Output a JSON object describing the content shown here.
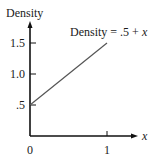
{
  "chart_data": {
    "type": "line",
    "title": "",
    "ylabel": "Density",
    "xlabel": "x",
    "annotation": "Density = .5 + x",
    "annotation_parts": {
      "prefix": "Density = .5 + ",
      "var": "x"
    },
    "xlim": [
      0,
      1.35
    ],
    "ylim": [
      0,
      1.75
    ],
    "x_ticks": [
      {
        "value": 1,
        "label": "1"
      }
    ],
    "x_origin_label": "0",
    "y_ticks": [
      {
        "value": 0.5,
        "label": ".5"
      },
      {
        "value": 1.0,
        "label": "1.0"
      },
      {
        "value": 1.5,
        "label": "1.5"
      }
    ],
    "series": [
      {
        "name": "Density = .5 + x",
        "x": [
          0,
          1
        ],
        "y": [
          0.5,
          1.5
        ]
      }
    ],
    "grid": false,
    "legend": "none"
  }
}
